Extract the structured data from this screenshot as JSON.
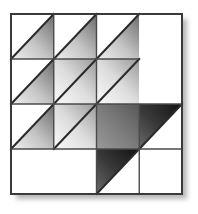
{
  "figure": {
    "type": "geometric-tiling",
    "background_color": "#ffffff",
    "canvas": {
      "width": 198,
      "height": 214
    }
  },
  "grid": {
    "rows": 4,
    "cols": 4,
    "origin": {
      "x": 11,
      "y": 14
    },
    "cell_width": 42.75,
    "cell_height": 45,
    "outer_border_color": "#3a3a3a",
    "outer_border_width": 2,
    "inner_line_color": "#4a4a4a",
    "inner_line_width": 1.4,
    "diagonal_color": "#2b2b2b",
    "diagonal_width": 2
  },
  "shadow": {
    "color": "#b9b9b9",
    "offset_x": 5,
    "offset_y": 5,
    "blur": 4
  },
  "palette": {
    "gradient_light": "#f2f2f2",
    "gradient_mid": "#c9c9c9",
    "gradient_dark": "#6e6e6e",
    "gradient_darker": "#4a4a4a",
    "gradient_darkest": "#1c1c1c",
    "empty": "#ffffff"
  },
  "legend": {
    "lower_right_label": "lower-right triangle",
    "upper_left_label": "upper-left triangle",
    "full_label": "full cell",
    "empty_label": "empty cell"
  },
  "cells": [
    {
      "row": 1,
      "col": 1,
      "fill": "lower-right",
      "shade": "mid"
    },
    {
      "row": 1,
      "col": 2,
      "fill": "lower-right",
      "shade": "mid"
    },
    {
      "row": 1,
      "col": 3,
      "fill": "lower-right",
      "shade": "mid"
    },
    {
      "row": 1,
      "col": 4,
      "fill": "empty",
      "shade": "none"
    },
    {
      "row": 2,
      "col": 1,
      "fill": "lower-right",
      "shade": "mid"
    },
    {
      "row": 2,
      "col": 2,
      "fill": "full",
      "shade": "light"
    },
    {
      "row": 2,
      "col": 3,
      "fill": "full",
      "shade": "light"
    },
    {
      "row": 2,
      "col": 4,
      "fill": "empty",
      "shade": "none"
    },
    {
      "row": 3,
      "col": 1,
      "fill": "lower-right",
      "shade": "mid"
    },
    {
      "row": 3,
      "col": 2,
      "fill": "full",
      "shade": "light"
    },
    {
      "row": 3,
      "col": 3,
      "fill": "full",
      "shade": "dark"
    },
    {
      "row": 3,
      "col": 4,
      "fill": "upper-left",
      "shade": "darkest"
    },
    {
      "row": 4,
      "col": 1,
      "fill": "empty",
      "shade": "none"
    },
    {
      "row": 4,
      "col": 2,
      "fill": "empty",
      "shade": "none"
    },
    {
      "row": 4,
      "col": 3,
      "fill": "upper-left",
      "shade": "darkest"
    },
    {
      "row": 4,
      "col": 4,
      "fill": "empty",
      "shade": "none"
    }
  ],
  "omitted_inner_lines": [
    {
      "description": "vertical divider between col 3 and col 4, rows 1-2",
      "x": 140,
      "y1": 14,
      "y2": 104
    },
    {
      "description": "horizontal divider between row 1 and row 2 in col 4",
      "y": 59,
      "x1": 140,
      "x2": 182
    },
    {
      "description": "vertical divider between col 1 and col 2 in row 4",
      "x": 54,
      "y1": 149,
      "y2": 194
    }
  ]
}
